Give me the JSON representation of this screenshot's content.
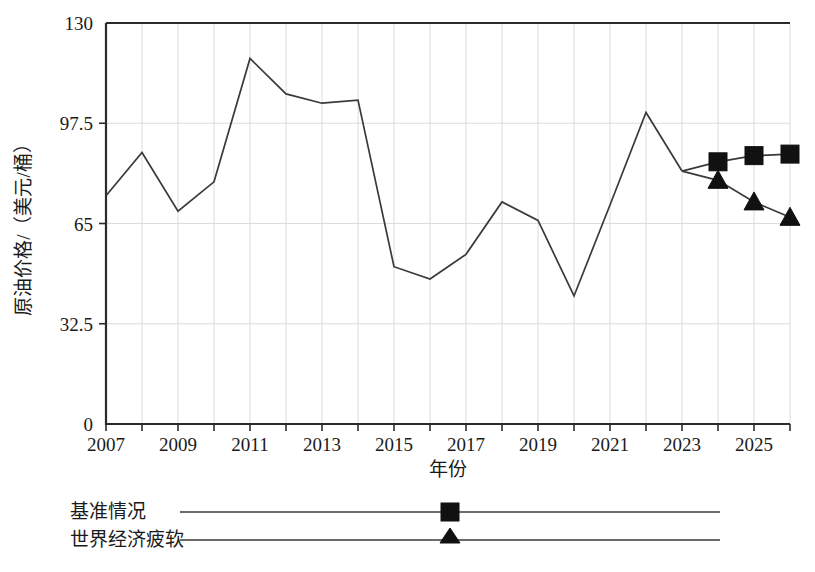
{
  "chart_data": {
    "type": "line",
    "title": "",
    "xlabel": "年份",
    "ylabel": "原油价格/（美元/桶）",
    "xlim": [
      2007,
      2026
    ],
    "ylim": [
      0,
      130
    ],
    "yticks": [
      "0",
      "32.5",
      "65",
      "97.5",
      "130"
    ],
    "ytick_values": [
      0,
      32.5,
      65,
      97.5,
      130
    ],
    "xticks": [
      "2007",
      "2009",
      "2011",
      "2013",
      "2015",
      "2017",
      "2019",
      "2021",
      "2023",
      "2025"
    ],
    "xtick_values": [
      2007,
      2009,
      2011,
      2013,
      2015,
      2017,
      2019,
      2021,
      2023,
      2025
    ],
    "grid": true,
    "legend_position": "below-axes",
    "x_history": [
      2007,
      2008,
      2009,
      2010,
      2011,
      2012,
      2013,
      2014,
      2015,
      2016,
      2017,
      2018,
      2019,
      2020,
      2021,
      2022,
      2023
    ],
    "series": [
      {
        "name": "历史",
        "marker": "none",
        "x": [
          2007,
          2008,
          2009,
          2010,
          2011,
          2012,
          2013,
          2014,
          2015,
          2016,
          2017,
          2018,
          2019,
          2020,
          2021,
          2022,
          2023
        ],
        "values": [
          74,
          88,
          69,
          78.5,
          118.5,
          107,
          104,
          105,
          51,
          47,
          55,
          72,
          66,
          41.5,
          71,
          101,
          82
        ]
      },
      {
        "name": "基准情况",
        "marker": "square",
        "x": [
          2023,
          2024,
          2025,
          2026
        ],
        "values": [
          82,
          85,
          87,
          87.5
        ]
      },
      {
        "name": "世界经济疲软",
        "marker": "triangle",
        "x": [
          2023,
          2024,
          2025,
          2026
        ],
        "values": [
          82,
          79,
          72,
          67
        ]
      }
    ]
  },
  "axes": {
    "y_title": "原油价格/（美元/桶）",
    "x_title": "年份"
  },
  "legend": {
    "items": [
      {
        "label": "基准情况",
        "marker": "square"
      },
      {
        "label": "世界经济疲软",
        "marker": "triangle"
      }
    ]
  },
  "caption": {
    "text": ""
  }
}
